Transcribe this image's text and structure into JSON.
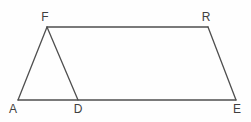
{
  "diagram": {
    "type": "geometric-figure",
    "canvas": {
      "width": 251,
      "height": 122,
      "background": "#fefefe"
    },
    "style": {
      "stroke_color": "#4f4f4f",
      "stroke_width": 1.3,
      "label_color": "#3f3f3f",
      "label_font_size": 12
    },
    "points": {
      "A": {
        "x": 18,
        "y": 100,
        "label": "A",
        "label_x": 13,
        "label_y": 113
      },
      "F": {
        "x": 47,
        "y": 27,
        "label": "F",
        "label_x": 45,
        "label_y": 21
      },
      "R": {
        "x": 208,
        "y": 27,
        "label": "R",
        "label_x": 206,
        "label_y": 21
      },
      "E": {
        "x": 236,
        "y": 100,
        "label": "E",
        "label_x": 237,
        "label_y": 113
      },
      "D": {
        "x": 78,
        "y": 100,
        "label": "D",
        "label_x": 78,
        "label_y": 113
      }
    },
    "edges": [
      [
        "A",
        "F"
      ],
      [
        "F",
        "R"
      ],
      [
        "R",
        "E"
      ],
      [
        "E",
        "A"
      ],
      [
        "F",
        "D"
      ]
    ]
  }
}
